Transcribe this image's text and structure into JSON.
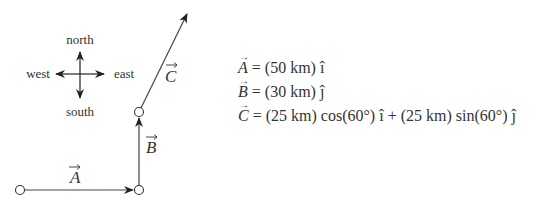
{
  "compass": {
    "north": "north",
    "south": "south",
    "east": "east",
    "west": "west"
  },
  "vectors": {
    "A": {
      "label": "A",
      "magnitude_km": 50,
      "direction": "east"
    },
    "B": {
      "label": "B",
      "magnitude_km": 30,
      "direction": "north"
    },
    "C": {
      "label": "C",
      "magnitude_km": 25,
      "angle_deg": 60
    }
  },
  "equations": [
    {
      "lhs": "A",
      "rhs": "= (50 km) î"
    },
    {
      "lhs": "B",
      "rhs": "= (30 km) ĵ"
    },
    {
      "lhs": "C",
      "rhs": "= (25 km) cos(60°) î + (25 km) sin(60°) ĵ"
    }
  ],
  "colors": {
    "line": "#333333",
    "background": "#ffffff"
  }
}
